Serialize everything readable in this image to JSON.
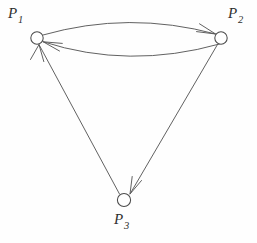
{
  "diagram": {
    "kind": "directed-graph",
    "background_color": "#fefefe",
    "line_color": "#585858",
    "node_fill_color": "#ffffff",
    "node_stroke_color": "#4a4a4a",
    "label_color": "#2e2e2e",
    "width": 257,
    "height": 243,
    "nodes": [
      {
        "id": "P1",
        "label_letter": "P",
        "label_subscript": "1",
        "cx": 37,
        "cy": 38,
        "r": 6.2,
        "label_x": 8,
        "label_y": 6
      },
      {
        "id": "P2",
        "label_letter": "P",
        "label_subscript": "2",
        "cx": 221,
        "cy": 38,
        "r": 6.2,
        "label_x": 228,
        "label_y": 6
      },
      {
        "id": "P3",
        "label_letter": "P",
        "label_subscript": "3",
        "cx": 124,
        "cy": 200,
        "r": 6.6,
        "label_x": 114,
        "label_y": 212
      }
    ],
    "edges": [
      {
        "id": "p1-to-p2",
        "from": "P1",
        "to": "P2",
        "shape": "curved",
        "curve_direction": "up",
        "arrowhead_at": "P2"
      },
      {
        "id": "p2-to-p1",
        "from": "P2",
        "to": "P1",
        "shape": "curved",
        "curve_direction": "down",
        "arrowhead_at": "P1"
      },
      {
        "id": "p2-to-p3",
        "from": "P2",
        "to": "P3",
        "shape": "straight",
        "curve_direction": "none",
        "arrowhead_at": "P3"
      },
      {
        "id": "p3-to-p1",
        "from": "P3",
        "to": "P1",
        "shape": "straight",
        "curve_direction": "none",
        "arrowhead_at": "P1"
      }
    ]
  }
}
